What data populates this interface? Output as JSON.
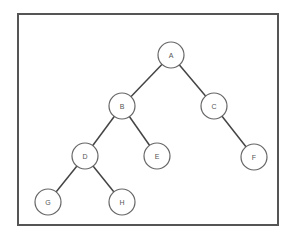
{
  "diagram": {
    "type": "binary-tree",
    "border_color": "#555555",
    "edge_color": "#444444",
    "node_stroke_color": "#666666",
    "node_radius": 13,
    "nodes": [
      {
        "id": "A",
        "label": "A",
        "x": 171,
        "y": 55
      },
      {
        "id": "B",
        "label": "B",
        "x": 122,
        "y": 106
      },
      {
        "id": "C",
        "label": "C",
        "x": 214,
        "y": 106
      },
      {
        "id": "D",
        "label": "D",
        "x": 85,
        "y": 156
      },
      {
        "id": "E",
        "label": "E",
        "x": 157,
        "y": 156
      },
      {
        "id": "F",
        "label": "F",
        "x": 254,
        "y": 157
      },
      {
        "id": "G",
        "label": "G",
        "x": 48,
        "y": 202
      },
      {
        "id": "H",
        "label": "H",
        "x": 122,
        "y": 202
      }
    ],
    "edges": [
      {
        "from": "A",
        "to": "B"
      },
      {
        "from": "A",
        "to": "C"
      },
      {
        "from": "B",
        "to": "D"
      },
      {
        "from": "B",
        "to": "E"
      },
      {
        "from": "C",
        "to": "F"
      },
      {
        "from": "D",
        "to": "G"
      },
      {
        "from": "D",
        "to": "H"
      }
    ]
  }
}
